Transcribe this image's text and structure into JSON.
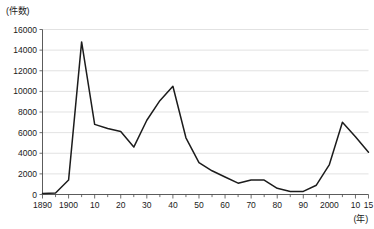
{
  "chart_data": {
    "type": "line",
    "title": "",
    "subtitle": "",
    "ylabel": "(件数)",
    "xlabel": "(年)",
    "ylim": [
      0,
      16000
    ],
    "xlim": [
      1890,
      2015
    ],
    "grid": true,
    "legend": false,
    "y_ticks": [
      0,
      2000,
      4000,
      6000,
      8000,
      10000,
      12000,
      14000,
      16000
    ],
    "y_tick_labels": [
      "0",
      "2000",
      "4000",
      "6000",
      "8000",
      "10000",
      "12000",
      "14000",
      "16000"
    ],
    "x_ticks": [
      1890,
      1900,
      1910,
      1920,
      1930,
      1940,
      1950,
      1960,
      1970,
      1980,
      1990,
      2000,
      2010,
      2015
    ],
    "x_tick_labels": [
      "1890",
      "1900",
      "10",
      "20",
      "30",
      "40",
      "50",
      "60",
      "70",
      "80",
      "90",
      "2000",
      "10",
      "15"
    ],
    "x_minor_tick_step": 5,
    "series": [
      {
        "name": "件数",
        "color": "#1c1c1c",
        "x": [
          1890,
          1895,
          1900,
          1905,
          1910,
          1915,
          1920,
          1925,
          1930,
          1935,
          1940,
          1945,
          1950,
          1955,
          1960,
          1965,
          1970,
          1975,
          1980,
          1985,
          1990,
          1995,
          2000,
          2005,
          2010,
          2015
        ],
        "values": [
          100,
          150,
          1400,
          14800,
          6800,
          6400,
          6100,
          4600,
          7200,
          9100,
          10500,
          5500,
          3100,
          2300,
          1700,
          1100,
          1400,
          1400,
          600,
          300,
          300,
          900,
          2900,
          7000,
          5600,
          4100
        ]
      }
    ]
  }
}
